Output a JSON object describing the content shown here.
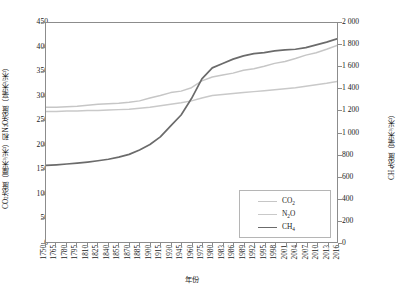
{
  "chart_data": {
    "type": "line",
    "title": "",
    "xlabel": "年份",
    "ylabel_left": "CO₂浓度（厘米³/米³）和N₂O浓度（毫米³/米³）",
    "ylabel_right": "CH₄浓度（毫米³/米³）",
    "grid": false,
    "legend_position": "bottom-right",
    "xlim": [
      1750,
      2016
    ],
    "ylim_left": [
      0,
      450
    ],
    "ylim_right": [
      0,
      2000
    ],
    "yticks_left": [
      0,
      50,
      100,
      150,
      200,
      250,
      300,
      350,
      400,
      450
    ],
    "yticks_right": [
      "0",
      "200",
      "400",
      "600",
      "800",
      "1 000",
      "1 200",
      "1 400",
      "1 600",
      "1 800",
      "2 000"
    ],
    "xticks": [
      "1750",
      "1765",
      "1780",
      "1795",
      "1810",
      "1825",
      "1840",
      "1855",
      "1870",
      "1885",
      "1900",
      "1915",
      "1930",
      "1945",
      "1960",
      "1975",
      "1980",
      "1983",
      "1986",
      "1989",
      "1992",
      "1995",
      "1998",
      "2001",
      "2004",
      "2007",
      "2010",
      "2013",
      "2016"
    ],
    "series": [
      {
        "name": "CO₂",
        "axis": "left",
        "color": "#c6c6c6",
        "x": [
          1750,
          1765,
          1780,
          1795,
          1810,
          1825,
          1840,
          1855,
          1870,
          1885,
          1900,
          1915,
          1930,
          1945,
          1960,
          1975,
          1980,
          1983,
          1986,
          1989,
          1992,
          1995,
          1998,
          2001,
          2004,
          2007,
          2010,
          2013,
          2016
        ],
        "values": [
          277,
          277,
          278,
          279,
          281,
          283,
          284,
          285,
          287,
          290,
          296,
          301,
          307,
          310,
          317,
          331,
          339,
          343,
          347,
          353,
          356,
          361,
          367,
          371,
          377,
          384,
          389,
          396,
          404
        ]
      },
      {
        "name": "N₂O",
        "axis": "left",
        "color": "#c9c9c9",
        "x": [
          1750,
          1765,
          1780,
          1795,
          1810,
          1825,
          1840,
          1855,
          1870,
          1885,
          1900,
          1915,
          1930,
          1945,
          1960,
          1975,
          1980,
          1983,
          1986,
          1989,
          1992,
          1995,
          1998,
          2001,
          2004,
          2007,
          2010,
          2013,
          2016
        ],
        "values": [
          268,
          268,
          269,
          269,
          270,
          270,
          271,
          272,
          273,
          275,
          277,
          280,
          283,
          286,
          290,
          296,
          301,
          303,
          305,
          307,
          309,
          311,
          313,
          315,
          317,
          320,
          323,
          326,
          330
        ]
      },
      {
        "name": "CH₄",
        "axis": "right",
        "color": "#6b6b6b",
        "x": [
          1750,
          1765,
          1780,
          1795,
          1810,
          1825,
          1840,
          1855,
          1870,
          1885,
          1900,
          1915,
          1930,
          1945,
          1960,
          1975,
          1980,
          1983,
          1986,
          1989,
          1992,
          1995,
          1998,
          2001,
          2004,
          2007,
          2010,
          2013,
          2016
        ],
        "values": [
          700,
          705,
          712,
          720,
          730,
          742,
          756,
          775,
          800,
          840,
          890,
          960,
          1060,
          1160,
          1310,
          1490,
          1590,
          1630,
          1670,
          1700,
          1720,
          1730,
          1745,
          1755,
          1760,
          1775,
          1800,
          1825,
          1855
        ]
      }
    ]
  },
  "legend": {
    "items": [
      {
        "label_main": "CO",
        "label_sub": "2"
      },
      {
        "label_main": "N",
        "label_sub": "2",
        "label_tail": "O"
      },
      {
        "label_main": "CH",
        "label_sub": "4"
      }
    ]
  }
}
